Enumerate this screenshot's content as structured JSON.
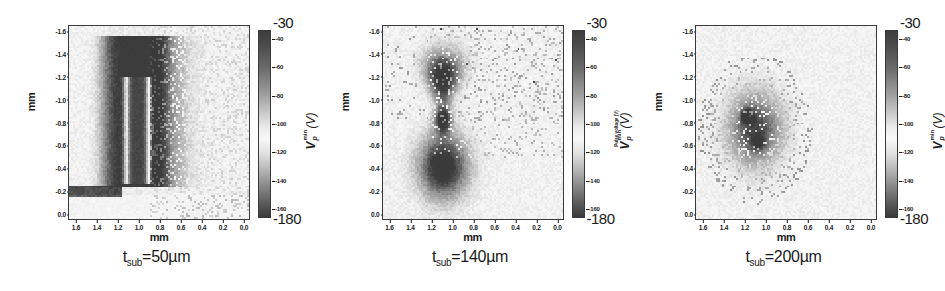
{
  "figure": {
    "type": "multi-panel-heatmap-figure",
    "panel_count": 3
  },
  "chart_data": [
    {
      "type": "heatmap",
      "title": "t_sub=50µm",
      "caption_prefix": "t",
      "caption_sub": "sub",
      "caption_value": "=50µm",
      "xlabel": "mm",
      "ylabel": "mm",
      "xticks": [
        "1.6",
        "1.4",
        "1.2",
        "1.0",
        "0.8",
        "0.6",
        "0.4",
        "0.2",
        "0.0"
      ],
      "yticks": [
        "-1.6",
        "-1.4",
        "-1.2",
        "-1.0",
        "-0.8",
        "-0.6",
        "-0.4",
        "-0.2",
        "0.0"
      ],
      "xlim": [
        1.7,
        0.0
      ],
      "ylim": [
        -1.7,
        0.0
      ],
      "grid": false,
      "colorbar": {
        "label": "V",
        "label_sup": "min",
        "label_sub": "p",
        "label_unit": "(V)",
        "subtitle": "",
        "top_label": "-30",
        "bottom_label": "-180",
        "ticks": [
          "-40",
          "-60",
          "-80",
          "-100",
          "-120",
          "-140",
          "-160"
        ],
        "vmin": -180,
        "vmax": -30,
        "colormap": "gray-nonmonotonic"
      },
      "features": "Bright elongated vertical halo ring centered near x=1.1 mm spanning y=-1.6 to -0.25 mm, enclosing a dark vertical core (most negative V_p^min, approx -170 V) from y=-1.25 to -0.3 mm; diffuse bright tail extends rightward toward x=0.6 mm; scattered dark speckle pixels throughout right half; uniform mid-gray background near -100 V."
    },
    {
      "type": "heatmap",
      "title": "t_sub=140µm",
      "caption_prefix": "t",
      "caption_sub": "sub",
      "caption_value": "=140µm",
      "xlabel": "mm",
      "ylabel": "mm",
      "xticks": [
        "1.6",
        "1.4",
        "1.2",
        "1.0",
        "0.8",
        "0.6",
        "0.4",
        "0.2",
        "0.0"
      ],
      "yticks": [
        "-1.6",
        "-1.4",
        "-1.2",
        "-1.0",
        "-0.8",
        "-0.6",
        "-0.4",
        "-0.2",
        "0.0"
      ],
      "xlim": [
        1.7,
        0.0
      ],
      "ylim": [
        -1.7,
        0.0
      ],
      "grid": false,
      "colorbar": {
        "label": "V",
        "label_sup": "min",
        "label_sub": "p",
        "label_unit": "(V)",
        "subtitle": "Pulse voltage (V)",
        "top_label": "-30",
        "bottom_label": "-180",
        "ticks": [
          "-40",
          "-60",
          "-80",
          "-100",
          "-120",
          "-140",
          "-160"
        ],
        "vmin": -180,
        "vmax": -30,
        "colormap": "gray-nonmonotonic"
      },
      "features": "Two bright hourglass-shaped lobes stacked vertically near x=1.15 mm: upper lobe y=-1.45 to -1.05 mm, lower lobe y=-0.75 to -0.2 mm, joined by a narrow bright waist near y=-0.9 mm; dense dark speckle scattered across the upper-right quadrant; mid-gray background."
    },
    {
      "type": "heatmap",
      "title": "t_sub=200µm",
      "caption_prefix": "t",
      "caption_sub": "sub",
      "caption_value": "=200µm",
      "xlabel": "mm",
      "ylabel": "mm",
      "xticks": [
        "1.6",
        "1.4",
        "1.2",
        "1.0",
        "0.8",
        "0.6",
        "0.4",
        "0.2",
        "0.0"
      ],
      "yticks": [
        "-1.6",
        "-1.4",
        "-1.2",
        "-1.0",
        "-0.8",
        "-0.6",
        "-0.4",
        "-0.2",
        "0.0"
      ],
      "xlim": [
        1.7,
        0.0
      ],
      "ylim": [
        -1.7,
        0.0
      ],
      "grid": false,
      "colorbar": {
        "label": "V",
        "label_sup": "min",
        "label_sub": "p",
        "label_unit": "(V)",
        "subtitle": "",
        "top_label": "-30",
        "bottom_label": "-180",
        "ticks": [
          "-40",
          "-60",
          "-80",
          "-100",
          "-120",
          "-140",
          "-160"
        ],
        "vmin": -180,
        "vmax": -30,
        "colormap": "gray-nonmonotonic"
      },
      "features": "Single compact irregular cluster centered near x=1.15 mm, y=-0.8 mm, roughly 0.5 mm across, containing two small very bright patches; surrounded by a sparse halo of dark speckle pixels extending to x=1.5-0.7 mm and y=-1.35 to -0.3 mm; otherwise featureless mid-gray background."
    }
  ]
}
